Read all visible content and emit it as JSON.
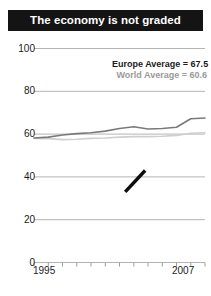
{
  "title": {
    "text": "The economy is not graded"
  },
  "legend": {
    "europe": "Europe Average = 67.5",
    "world": "World Average = 60.6"
  },
  "axis": {
    "y_ticks": [
      "100",
      "80",
      "60",
      "40",
      "20",
      "0"
    ],
    "x_start": "1995",
    "x_end": "2007"
  },
  "colors": {
    "title_bar": "#141414",
    "title_text": "#ffffff",
    "grid": "#b4b4b4",
    "europe_line": "#7a7a7a",
    "world_line": "#cfcfcf",
    "annotation_stroke": "#0d0d0d",
    "tick_text": "#1a1a1a"
  },
  "chart_data": {
    "type": "line",
    "title": "The economy is not graded",
    "xlabel": "",
    "ylabel": "",
    "xlim": [
      1995,
      2007
    ],
    "ylim": [
      0,
      100
    ],
    "grid": true,
    "legend_position": "top-right",
    "x": [
      1995,
      1996,
      1997,
      1998,
      1999,
      2000,
      2001,
      2002,
      2003,
      2004,
      2005,
      2006,
      2007
    ],
    "categories": [
      "1995",
      "1996",
      "1997",
      "1998",
      "1999",
      "2000",
      "2001",
      "2002",
      "2003",
      "2004",
      "2005",
      "2006",
      "2007"
    ],
    "series": [
      {
        "name": "Europe Average",
        "final_value": 67.5,
        "values": [
          58.2,
          58.6,
          59.6,
          60.2,
          60.6,
          61.4,
          62.6,
          63.4,
          62.4,
          62.6,
          63.2,
          67.2,
          67.5
        ]
      },
      {
        "name": "World Average",
        "final_value": 60.6,
        "values": [
          58.0,
          57.9,
          57.4,
          57.6,
          58.0,
          58.2,
          58.6,
          58.8,
          58.8,
          59.0,
          59.4,
          60.4,
          60.6
        ]
      }
    ],
    "annotations": [
      {
        "name": "hand-drawn-slash",
        "type": "stroke",
        "from": [
          2001.4,
          33.0
        ],
        "to": [
          2002.8,
          43.0
        ]
      }
    ]
  }
}
